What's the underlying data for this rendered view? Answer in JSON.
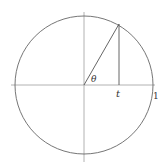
{
  "diagram": {
    "type": "unit-circle",
    "labels": {
      "angle": "θ",
      "projection": "t",
      "unit": "1"
    },
    "colors": {
      "line": "#555555",
      "axis": "#999999",
      "text": "#333333"
    },
    "geometry": {
      "center": [
        84,
        85
      ],
      "radius": 69,
      "point": [
        119,
        24
      ]
    }
  }
}
